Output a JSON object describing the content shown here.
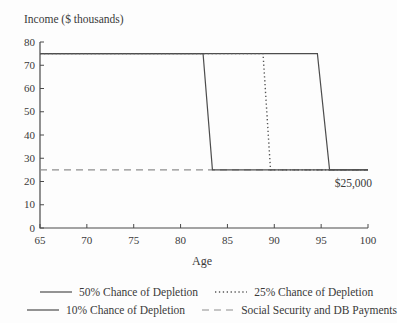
{
  "figure": {
    "background": "#fdfdfd"
  },
  "chart_data": {
    "type": "line",
    "title": "Income ($ thousands)",
    "xlabel": "Age",
    "ylabel": "Income ($ thousands)",
    "xlim": [
      65,
      100
    ],
    "ylim": [
      0,
      80
    ],
    "x_ticks": [
      65,
      70,
      75,
      80,
      85,
      90,
      95,
      100
    ],
    "y_ticks": [
      0,
      10,
      20,
      30,
      40,
      50,
      60,
      70,
      80
    ],
    "grid": false,
    "legend_position": "bottom",
    "annotation": {
      "text": "$25,000",
      "x": 100,
      "y": 21
    },
    "series": [
      {
        "name": "50% Chance of Depletion",
        "style": "solid",
        "points": [
          [
            65,
            75
          ],
          [
            82.4,
            75
          ],
          [
            83.4,
            25
          ],
          [
            100,
            25
          ]
        ]
      },
      {
        "name": "25% Chance of Depletion",
        "style": "dotted",
        "points": [
          [
            65,
            75
          ],
          [
            88.8,
            75
          ],
          [
            89.6,
            25
          ],
          [
            100,
            25
          ]
        ]
      },
      {
        "name": "10% Chance of Depletion",
        "style": "solid",
        "points": [
          [
            65,
            75
          ],
          [
            94.6,
            75
          ],
          [
            95.9,
            25
          ],
          [
            100,
            25
          ]
        ]
      },
      {
        "name": "Social Security and DB Payments",
        "style": "dashed",
        "points": [
          [
            65,
            25
          ],
          [
            100,
            25
          ]
        ]
      }
    ]
  },
  "legend": {
    "rows": [
      {
        "items": [
          {
            "style": "solid",
            "label": "50% Chance of Depletion"
          },
          {
            "style": "dotted",
            "label": "25% Chance of Depletion"
          }
        ]
      },
      {
        "items": [
          {
            "style": "solid",
            "label": "10% Chance of Depletion"
          },
          {
            "style": "dashed",
            "label": "Social Security and DB Payments"
          }
        ]
      }
    ]
  },
  "colors": {
    "axis": "#4a4a4a",
    "solid_line": "#4d4d4d",
    "dotted_line": "#555555",
    "dashed_line": "#8e8e8e",
    "text": "#3a3a3a"
  }
}
